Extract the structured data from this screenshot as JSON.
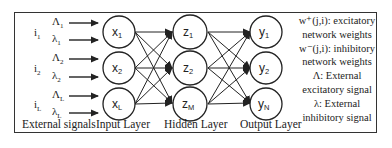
{
  "diagram": {
    "type": "neural-network",
    "layers": {
      "external": {
        "caption": "External signals",
        "groups": [
          {
            "input": "i",
            "input_sub": "1",
            "exc": "Λ",
            "exc_sub": "1",
            "inh": "λ",
            "inh_sub": "1"
          },
          {
            "input": "i",
            "input_sub": "2",
            "exc": "Λ",
            "exc_sub": "2",
            "inh": "λ",
            "inh_sub": "2"
          },
          {
            "input": "i",
            "input_sub": "L",
            "exc": "Λ",
            "exc_sub": "L",
            "inh": "λ",
            "inh_sub": "L"
          }
        ]
      },
      "input": {
        "caption": "Input Layer",
        "nodes": [
          {
            "base": "x",
            "sub": "1"
          },
          {
            "base": "x",
            "sub": "2"
          },
          {
            "base": "x",
            "sub": "L"
          }
        ]
      },
      "hidden": {
        "caption": "Hidden Layer",
        "nodes": [
          {
            "base": "z",
            "sub": "1"
          },
          {
            "base": "z",
            "sub": "2"
          },
          {
            "base": "z",
            "sub": "M"
          }
        ]
      },
      "output": {
        "caption": "Output Layer",
        "nodes": [
          {
            "base": "y",
            "sub": "1"
          },
          {
            "base": "y",
            "sub": "2"
          },
          {
            "base": "y",
            "sub": "N"
          }
        ]
      }
    },
    "legend": [
      "w⁺(j,i): excitatory",
      "network weights",
      "w⁻(j,i): inhibitory",
      "network weights",
      "Λ: External",
      "excitatory signal",
      "λ: External",
      "inhibitory signal"
    ],
    "colors": {
      "stroke": "#222222",
      "background": "#ffffff"
    }
  }
}
